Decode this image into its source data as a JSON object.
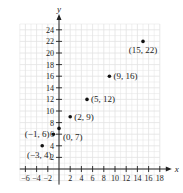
{
  "chart_data": {
    "type": "scatter",
    "title": "",
    "xlabel": "x",
    "ylabel": "y",
    "xlim": [
      -7,
      18
    ],
    "ylim": [
      -2,
      25
    ],
    "grid": true,
    "legend": null,
    "x_ticks": [
      -6,
      -4,
      -2,
      2,
      4,
      6,
      8,
      10,
      12,
      14,
      16,
      18
    ],
    "y_ticks": [
      2,
      4,
      6,
      8,
      10,
      12,
      14,
      16,
      18,
      20,
      22,
      24
    ],
    "points": [
      {
        "x": -3,
        "y": 4,
        "label": "(−3, 4)"
      },
      {
        "x": -1,
        "y": 6,
        "label": "(−1, 6)"
      },
      {
        "x": 0,
        "y": 7,
        "label": "(0, 7)"
      },
      {
        "x": 2,
        "y": 9,
        "label": "(2, 9)"
      },
      {
        "x": 5,
        "y": 12,
        "label": "(5, 12)"
      },
      {
        "x": 9,
        "y": 16,
        "label": "(9, 16)"
      },
      {
        "x": 15,
        "y": 22,
        "label": "(15, 22)"
      }
    ],
    "colors": {
      "grid": "#e2e2e2",
      "axis": "#222222",
      "point": "#111111"
    }
  }
}
